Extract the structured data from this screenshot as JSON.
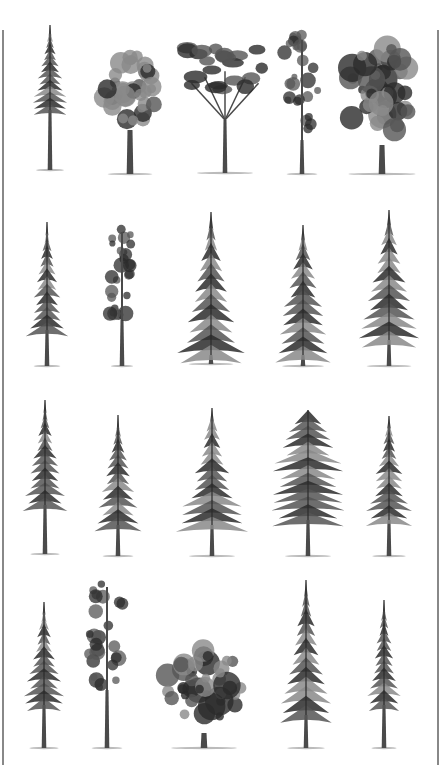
{
  "palette": {
    "background": "#ffffff",
    "foliage_dark": "#2b2b2b",
    "foliage_mid": "#555555",
    "foliage_light": "#8a8a8a",
    "trunk": "#4a4a4a",
    "frame": "#888888"
  },
  "rows": [
    {
      "trees": [
        {
          "type": "conifer",
          "x": 50,
          "top": 25,
          "base": 170,
          "width": 40,
          "trunk_start": 110
        },
        {
          "type": "broadleaf-oval",
          "x": 130,
          "top": 47,
          "base": 174,
          "width": 64,
          "trunk_start": 130
        },
        {
          "type": "umbrella-pine",
          "x": 225,
          "top": 45,
          "base": 173,
          "width": 80,
          "trunk_start": 120
        },
        {
          "type": "columnar-pine",
          "x": 302,
          "top": 35,
          "base": 174,
          "width": 44,
          "trunk_start": 140
        },
        {
          "type": "broadleaf-large",
          "x": 382,
          "top": 40,
          "base": 174,
          "width": 96,
          "trunk_start": 145
        }
      ]
    },
    {
      "trees": [
        {
          "type": "conifer",
          "x": 47,
          "top": 222,
          "base": 366,
          "width": 38,
          "trunk_start": 330
        },
        {
          "type": "columnar-pine",
          "x": 122,
          "top": 227,
          "base": 366,
          "width": 32,
          "trunk_start": 320
        },
        {
          "type": "spruce-full",
          "x": 211,
          "top": 212,
          "base": 364,
          "width": 64,
          "trunk_start": 355
        },
        {
          "type": "fir",
          "x": 303,
          "top": 225,
          "base": 366,
          "width": 60,
          "trunk_start": 355
        },
        {
          "type": "spruce-open",
          "x": 389,
          "top": 210,
          "base": 366,
          "width": 64,
          "trunk_start": 340
        }
      ]
    },
    {
      "trees": [
        {
          "type": "conifer",
          "x": 45,
          "top": 400,
          "base": 554,
          "width": 42,
          "trunk_start": 505
        },
        {
          "type": "conifer",
          "x": 118,
          "top": 415,
          "base": 556,
          "width": 44,
          "trunk_start": 525
        },
        {
          "type": "spruce-open",
          "x": 212,
          "top": 408,
          "base": 556,
          "width": 66,
          "trunk_start": 525
        },
        {
          "type": "broad-conifer",
          "x": 308,
          "top": 410,
          "base": 556,
          "width": 66,
          "trunk_start": 520
        },
        {
          "type": "spruce-open",
          "x": 389,
          "top": 416,
          "base": 556,
          "width": 48,
          "trunk_start": 520
        }
      ]
    },
    {
      "trees": [
        {
          "type": "conifer",
          "x": 44,
          "top": 602,
          "base": 748,
          "width": 42,
          "trunk_start": 705
        },
        {
          "type": "columnar-pine",
          "x": 107,
          "top": 582,
          "base": 748,
          "width": 44,
          "trunk_start": 690
        },
        {
          "type": "broadleaf-round",
          "x": 204,
          "top": 642,
          "base": 748,
          "width": 94,
          "trunk_start": 733
        },
        {
          "type": "spruce-full",
          "x": 306,
          "top": 580,
          "base": 748,
          "width": 54,
          "trunk_start": 715
        },
        {
          "type": "conifer",
          "x": 384,
          "top": 600,
          "base": 748,
          "width": 36,
          "trunk_start": 705
        }
      ]
    }
  ]
}
